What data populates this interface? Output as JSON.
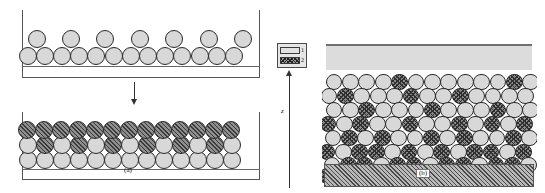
{
  "figure": {
    "panel_a_label": "(a)",
    "panel_b_label": "(b)",
    "axis_z_label": "z",
    "arrow_direction": "down",
    "colors": {
      "sphere_light": "#d8d8d8",
      "sphere_hatched": "#8f8f8f",
      "hatch_line": "#3a3a3a",
      "outline": "#2a2a2a",
      "frame": "#555555",
      "top_band": "#dcdcdc",
      "substrate": "#b9b9b9"
    }
  },
  "legend": {
    "items": [
      {
        "id": "1",
        "label": "1",
        "fill": "plain",
        "swatch_color": "#e2e2e2"
      },
      {
        "id": "2",
        "label": "2",
        "fill": "checker",
        "swatch_color": "#9a9a9a"
      }
    ]
  },
  "panel_a": {
    "title": "(a)",
    "stage_initial": {
      "description": "loose packing",
      "rows": [
        {
          "index": 0,
          "y": 56,
          "r": 9.0,
          "x_start": 27.5,
          "spacing": 17.2,
          "count": 13,
          "fills": [
            "light",
            "light",
            "light",
            "light",
            "light",
            "light",
            "light",
            "light",
            "light",
            "light",
            "light",
            "light",
            "light"
          ]
        },
        {
          "index": 1,
          "y": 39,
          "r": 9.0,
          "x_start": 36.5,
          "spacing": 34.4,
          "count": 7,
          "fills": [
            "light",
            "light",
            "light",
            "light",
            "light",
            "light",
            "light"
          ]
        }
      ]
    },
    "stage_compacted": {
      "description": "dense packing after compaction",
      "rows": [
        {
          "index": 0,
          "y": 160,
          "r": 9.0,
          "x_start": 27.5,
          "spacing": 17.0,
          "count": 13,
          "fills": [
            "light",
            "light",
            "light",
            "light",
            "light",
            "light",
            "light",
            "light",
            "light",
            "light",
            "light",
            "light",
            "light"
          ]
        },
        {
          "index": 1,
          "y": 145,
          "r": 9.0,
          "x_start": 28.0,
          "spacing": 17.0,
          "count": 13,
          "fills": [
            "light",
            "hatch",
            "light",
            "hatch",
            "light",
            "hatch",
            "light",
            "hatch",
            "light",
            "hatch",
            "light",
            "hatch",
            "light"
          ]
        },
        {
          "index": 2,
          "y": 130,
          "r": 9.0,
          "x_start": 27.0,
          "spacing": 17.0,
          "count": 13,
          "fills": [
            "hatch",
            "hatch",
            "hatch",
            "hatch",
            "hatch",
            "hatch",
            "hatch",
            "hatch",
            "hatch",
            "hatch",
            "hatch",
            "hatch",
            "hatch"
          ]
        }
      ]
    }
  },
  "panel_b": {
    "title": "(b)",
    "description": "dense random binary packing between supernatant band and hatched substrate",
    "top_band_label": "supernatant",
    "substrate_label": "substrate",
    "rows": [
      {
        "index": 0,
        "y": 82,
        "r": 8.4,
        "x_start": 334,
        "spacing": 16.4,
        "count": 13,
        "fills": [
          "light",
          "light",
          "light",
          "light",
          "xhatch",
          "light",
          "light",
          "light",
          "light",
          "light",
          "light",
          "xhatch",
          "light"
        ]
      },
      {
        "index": 1,
        "y": 96,
        "r": 8.4,
        "x_start": 329,
        "spacing": 16.4,
        "count": 13,
        "fills": [
          "light",
          "xhatch",
          "light",
          "light",
          "light",
          "xhatch",
          "light",
          "light",
          "xhatch",
          "light",
          "light",
          "light",
          "light"
        ]
      },
      {
        "index": 2,
        "y": 110,
        "r": 8.4,
        "x_start": 334,
        "spacing": 16.4,
        "count": 13,
        "fills": [
          "light",
          "light",
          "xhatch",
          "light",
          "light",
          "light",
          "xhatch",
          "light",
          "light",
          "light",
          "xhatch",
          "light",
          "light"
        ]
      },
      {
        "index": 3,
        "y": 124,
        "r": 8.4,
        "x_start": 328,
        "spacing": 16.4,
        "count": 13,
        "fills": [
          "xhatch",
          "light",
          "xhatch",
          "light",
          "light",
          "xhatch",
          "light",
          "light",
          "xhatch",
          "light",
          "xhatch",
          "light",
          "xhatch"
        ]
      },
      {
        "index": 4,
        "y": 138,
        "r": 8.4,
        "x_start": 333,
        "spacing": 16.4,
        "count": 13,
        "fills": [
          "light",
          "xhatch",
          "light",
          "xhatch",
          "light",
          "light",
          "xhatch",
          "light",
          "xhatch",
          "light",
          "light",
          "xhatch",
          "light"
        ]
      },
      {
        "index": 5,
        "y": 152,
        "r": 8.4,
        "x_start": 327,
        "spacing": 16.4,
        "count": 13,
        "fills": [
          "xhatch",
          "light",
          "xhatch",
          "xhatch",
          "light",
          "xhatch",
          "light",
          "xhatch",
          "light",
          "xhatch",
          "xhatch",
          "light",
          "xhatch"
        ]
      },
      {
        "index": 6,
        "y": 165,
        "r": 8.4,
        "x_start": 332,
        "spacing": 16.4,
        "count": 13,
        "fills": [
          "light",
          "xhatch",
          "xhatch",
          "light",
          "xhatch",
          "xhatch",
          "light",
          "xhatch",
          "xhatch",
          "light",
          "xhatch",
          "xhatch",
          "light"
        ]
      },
      {
        "index": 7,
        "y": 176,
        "r": 8.4,
        "x_start": 327,
        "spacing": 16.4,
        "count": 13,
        "fills": [
          "xhatch",
          "xhatch",
          "light",
          "xhatch",
          "xhatch",
          "xhatch",
          "light",
          "xhatch",
          "xhatch",
          "xhatch",
          "light",
          "xhatch",
          "xhatch"
        ]
      }
    ]
  }
}
